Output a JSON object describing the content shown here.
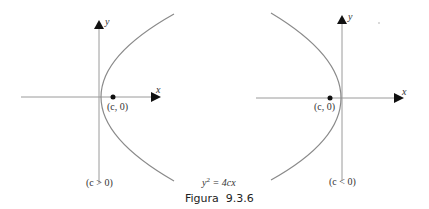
{
  "figure": {
    "caption": "Figura  9.3.6",
    "equation_base": "y",
    "equation_exp": "2",
    "equation_rest": " = 4cx"
  },
  "left_graph": {
    "axis_x_label": "x",
    "axis_y_label": "y",
    "focus_label": "(c, 0)",
    "condition_label": "(c > 0)",
    "opens": "right"
  },
  "right_graph": {
    "axis_x_label": "x",
    "axis_y_label": "y",
    "focus_label": "(c, 0)",
    "condition_label": "(c < 0)",
    "opens": "left"
  },
  "colors": {
    "axis": "#9a9a9a",
    "curve": "#8a8a8a",
    "arrow": "#111111",
    "point": "#111111",
    "text": "#333333"
  }
}
